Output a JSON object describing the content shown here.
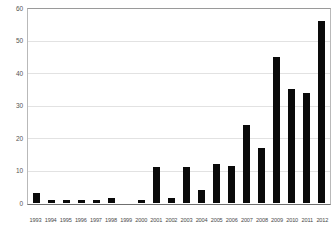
{
  "chart_data": {
    "type": "bar",
    "title": "",
    "subtitle": "",
    "xlabel": "",
    "ylabel": "",
    "ylim": [
      0,
      60
    ],
    "yticks": [
      0,
      10,
      20,
      30,
      40,
      50,
      60
    ],
    "ytick_labels": [
      "0",
      "10",
      "20",
      "30",
      "40",
      "50",
      "60"
    ],
    "grid": true,
    "legend": false,
    "legend_position": "none",
    "bar_color": "#0a0a0a",
    "categories": [
      "1993",
      "1994",
      "1995",
      "1996",
      "1997",
      "1998",
      "1999",
      "2000",
      "2001",
      "2002",
      "2003",
      "2004",
      "2005",
      "2006",
      "2007",
      "2008",
      "2009",
      "2010",
      "2011",
      "2012"
    ],
    "values": [
      3,
      1,
      1,
      1,
      1,
      1.5,
      0,
      1,
      11,
      1.5,
      11,
      4,
      12,
      11.5,
      24,
      17,
      45,
      35,
      34,
      56
    ],
    "series": [
      {
        "name": "Publications per year",
        "values": [
          3,
          1,
          1,
          1,
          1,
          1.5,
          0,
          1,
          11,
          1.5,
          11,
          4,
          12,
          11.5,
          24,
          17,
          45,
          35,
          34,
          56
        ]
      }
    ]
  }
}
